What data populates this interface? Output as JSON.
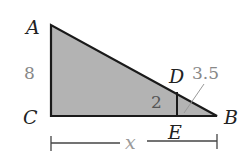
{
  "figure": {
    "type": "similar-triangles",
    "fill_color": "#b3b3b3",
    "stroke_color": "#1a1a1a",
    "vertices": {
      "A": "A",
      "B": "B",
      "C": "C",
      "D": "D",
      "E": "E"
    },
    "segments": {
      "AC_length": "8",
      "DE_length": "2",
      "EB_length": "3.5",
      "CB_length": "x"
    }
  }
}
